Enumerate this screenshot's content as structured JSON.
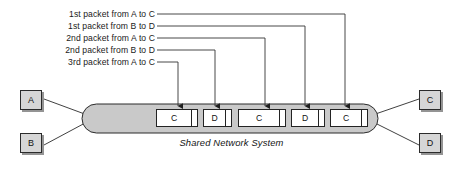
{
  "diagram": {
    "bus_caption": "Shared Network System",
    "colors": {
      "background": "#ffffff",
      "bus_fill": "#c9c9c9",
      "bus_stroke": "#2b2b2b",
      "node_fill": "#d6d6d6",
      "node_stroke": "#2b2b2b",
      "packet_fill": "#ffffff",
      "packet_stroke": "#232323",
      "leader_line": "#333333",
      "text": "#141414"
    }
  },
  "callouts": [
    {
      "text": "1st packet from A to C",
      "label_right": 155,
      "label_y": 9,
      "corner_x": 345,
      "target_x": 345,
      "target_y": 106
    },
    {
      "text": "1st packet from B to D",
      "label_right": 155,
      "label_y": 21,
      "corner_x": 305,
      "target_x": 305,
      "target_y": 106
    },
    {
      "text": "2nd packet from A to C",
      "label_right": 155,
      "label_y": 33,
      "corner_x": 265,
      "target_x": 265,
      "target_y": 106
    },
    {
      "text": "2nd packet from B to D",
      "label_right": 155,
      "label_y": 45,
      "corner_x": 215,
      "target_x": 215,
      "target_y": 106
    },
    {
      "text": "3rd packet from A to C",
      "label_right": 155,
      "label_y": 57,
      "corner_x": 178,
      "target_x": 178,
      "target_y": 106
    }
  ],
  "nodes": [
    {
      "id": "A",
      "label": "A",
      "role": "source",
      "x": 20,
      "y": 90
    },
    {
      "id": "B",
      "label": "B",
      "role": "source",
      "x": 20,
      "y": 133
    },
    {
      "id": "C",
      "label": "C",
      "role": "destination",
      "x": 419,
      "y": 90
    },
    {
      "id": "D",
      "label": "D",
      "role": "destination",
      "x": 419,
      "y": 133
    }
  ],
  "packets": [
    {
      "label": "C",
      "x": 156,
      "width": 42,
      "destination": "C"
    },
    {
      "label": "D",
      "x": 203,
      "width": 29,
      "destination": "D"
    },
    {
      "label": "C",
      "x": 238,
      "width": 48,
      "destination": "C"
    },
    {
      "label": "D",
      "x": 291,
      "width": 34,
      "destination": "D"
    },
    {
      "label": "C",
      "x": 330,
      "width": 38,
      "destination": "C"
    }
  ],
  "bus": {
    "x": 82,
    "y": 104,
    "width": 296,
    "height": 29,
    "radius": 14.5
  }
}
